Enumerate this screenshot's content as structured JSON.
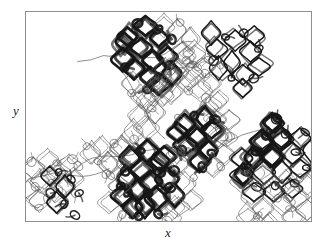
{
  "figure": {
    "type": "scatter",
    "background_color": "#ffffff",
    "frame": {
      "x": 25,
      "y": 11,
      "width": 287,
      "height": 211,
      "border_color": "#8e8e8e",
      "border_width": 1
    },
    "axes": {
      "x_label": "x",
      "y_label": "y",
      "x_tick_labels": [],
      "y_tick_labels": [],
      "grid": false
    }
  },
  "chart_data": {
    "type": "scatter",
    "title": "",
    "subtitle": "",
    "xlabel": "x",
    "ylabel": "y",
    "xlim": [
      0,
      287
    ],
    "ylim": [
      0,
      211
    ],
    "grid": false,
    "legend": null,
    "annotations": [],
    "styles": {
      "thick_stroke_color": "#171717",
      "thin_stroke_color": "#595959",
      "thick_stroke_width": 2.6,
      "medium_stroke_width": 1.5,
      "thin_stroke_width": 0.8,
      "cell_width": 20,
      "cell_height": 22,
      "loop_radius": 4.2
    },
    "clusters": [
      {
        "name": "top-left-dense",
        "origin": [
          95,
          10
        ],
        "weight": "thick",
        "cells": [
          [
            8,
            14
          ],
          [
            26,
            6
          ],
          [
            20,
            26
          ],
          [
            38,
            18
          ],
          [
            4,
            36
          ],
          [
            32,
            38
          ],
          [
            14,
            48
          ],
          [
            46,
            34
          ],
          [
            28,
            56
          ],
          [
            52,
            52
          ],
          [
            40,
            62
          ],
          [
            2,
            22
          ]
        ],
        "loops": [
          [
            18,
            2
          ],
          [
            6,
            46
          ],
          [
            40,
            8
          ],
          [
            50,
            44
          ],
          [
            26,
            68
          ],
          [
            52,
            18
          ]
        ]
      },
      {
        "name": "top-left-light",
        "origin": [
          95,
          10
        ],
        "weight": "thin",
        "cells": [
          [
            56,
            10
          ],
          [
            64,
            30
          ],
          [
            44,
            4
          ],
          [
            60,
            50
          ],
          [
            70,
            16
          ],
          [
            34,
            74
          ],
          [
            50,
            72
          ],
          [
            22,
            74
          ],
          [
            12,
            62
          ],
          [
            68,
            58
          ]
        ],
        "loops": [
          [
            60,
            2
          ],
          [
            72,
            42
          ],
          [
            36,
            62
          ],
          [
            10,
            72
          ],
          [
            68,
            70
          ]
        ]
      },
      {
        "name": "top-right",
        "origin": [
          186,
          20
        ],
        "weight": "medium",
        "cells": [
          [
            6,
            16
          ],
          [
            24,
            8
          ],
          [
            20,
            30
          ],
          [
            38,
            22
          ],
          [
            10,
            38
          ],
          [
            34,
            42
          ],
          [
            46,
            6
          ],
          [
            50,
            34
          ],
          [
            2,
            2
          ],
          [
            30,
            56
          ]
        ],
        "loops": [
          [
            16,
            4
          ],
          [
            34,
            2
          ],
          [
            4,
            28
          ],
          [
            44,
            48
          ],
          [
            22,
            46
          ],
          [
            50,
            18
          ]
        ]
      },
      {
        "name": "center-diagonal-strand",
        "origin": [
          98,
          56
        ],
        "weight": "thin",
        "cells": [
          [
            40,
            2
          ],
          [
            32,
            18
          ],
          [
            24,
            34
          ],
          [
            16,
            50
          ],
          [
            8,
            66
          ],
          [
            0,
            82
          ],
          [
            48,
            12
          ],
          [
            40,
            28
          ],
          [
            32,
            44
          ],
          [
            24,
            60
          ]
        ],
        "loops": [
          [
            44,
            10
          ],
          [
            28,
            42
          ],
          [
            12,
            74
          ]
        ]
      },
      {
        "name": "right-diagonal-strand",
        "origin": [
          160,
          40
        ],
        "weight": "thin",
        "cells": [
          [
            0,
            6
          ],
          [
            8,
            22
          ],
          [
            16,
            38
          ],
          [
            24,
            54
          ],
          [
            32,
            70
          ],
          [
            40,
            86
          ],
          [
            10,
            2
          ],
          [
            18,
            18
          ],
          [
            26,
            34
          ],
          [
            34,
            50
          ]
        ],
        "loops": [
          [
            4,
            14
          ],
          [
            20,
            46
          ],
          [
            36,
            78
          ]
        ]
      },
      {
        "name": "center-dark",
        "origin": [
          152,
          106
        ],
        "weight": "thick",
        "cells": [
          [
            8,
            6
          ],
          [
            26,
            0
          ],
          [
            18,
            20
          ],
          [
            36,
            14
          ],
          [
            10,
            30
          ],
          [
            30,
            34
          ],
          [
            22,
            44
          ],
          [
            2,
            16
          ]
        ],
        "loops": [
          [
            18,
            0
          ],
          [
            4,
            34
          ],
          [
            36,
            38
          ],
          [
            26,
            52
          ],
          [
            40,
            2
          ]
        ]
      },
      {
        "name": "center-dark-light-halo",
        "origin": [
          152,
          100
        ],
        "weight": "thin",
        "cells": [
          [
            42,
            24
          ],
          [
            0,
            44
          ],
          [
            46,
            44
          ],
          [
            36,
            56
          ],
          [
            52,
            8
          ]
        ],
        "loops": [
          [
            52,
            28
          ],
          [
            44,
            56
          ],
          [
            0,
            8
          ]
        ]
      },
      {
        "name": "bottom-center-dense",
        "origin": [
          96,
          138
        ],
        "weight": "thick",
        "cells": [
          [
            10,
            10
          ],
          [
            28,
            2
          ],
          [
            20,
            22
          ],
          [
            38,
            14
          ],
          [
            6,
            30
          ],
          [
            30,
            34
          ],
          [
            16,
            42
          ],
          [
            46,
            30
          ],
          [
            36,
            50
          ],
          [
            24,
            58
          ],
          [
            52,
            48
          ],
          [
            0,
            48
          ],
          [
            44,
            8
          ],
          [
            12,
            60
          ]
        ],
        "loops": [
          [
            20,
            2
          ],
          [
            4,
            22
          ],
          [
            40,
            24
          ],
          [
            8,
            44
          ],
          [
            28,
            46
          ],
          [
            48,
            40
          ],
          [
            18,
            68
          ],
          [
            38,
            66
          ],
          [
            54,
            24
          ],
          [
            0,
            36
          ]
        ]
      },
      {
        "name": "bottom-center-light",
        "origin": [
          96,
          134
        ],
        "weight": "thin",
        "cells": [
          [
            58,
            18
          ],
          [
            62,
            38
          ],
          [
            56,
            62
          ],
          [
            -8,
            18
          ],
          [
            -4,
            40
          ],
          [
            66,
            8
          ],
          [
            70,
            56
          ],
          [
            -12,
            58
          ],
          [
            50,
            72
          ],
          [
            8,
            76
          ]
        ],
        "loops": [
          [
            64,
            6
          ],
          [
            72,
            34
          ],
          [
            -10,
            32
          ],
          [
            46,
            76
          ],
          [
            0,
            70
          ]
        ]
      },
      {
        "name": "bottom-left",
        "origin": [
          2,
          146
        ],
        "weight": "thin",
        "cells": [
          [
            4,
            12
          ],
          [
            20,
            4
          ],
          [
            14,
            24
          ],
          [
            30,
            16
          ],
          [
            0,
            32
          ],
          [
            26,
            36
          ],
          [
            40,
            8
          ],
          [
            36,
            30
          ],
          [
            10,
            44
          ],
          [
            46,
            22
          ]
        ],
        "loops": [
          [
            2,
            4
          ],
          [
            16,
            16
          ],
          [
            30,
            6
          ],
          [
            8,
            30
          ],
          [
            24,
            28
          ],
          [
            40,
            22
          ],
          [
            12,
            50
          ],
          [
            34,
            48
          ],
          [
            48,
            38
          ],
          [
            52,
            10
          ],
          [
            20,
            42
          ],
          [
            46,
            4
          ]
        ]
      },
      {
        "name": "bottom-left-far",
        "origin": [
          26,
          160
        ],
        "weight": "medium",
        "cells": [
          [
            0,
            6
          ],
          [
            12,
            18
          ],
          [
            4,
            30
          ]
        ],
        "loops": [
          [
            6,
            2
          ],
          [
            18,
            10
          ],
          [
            0,
            22
          ],
          [
            14,
            34
          ],
          [
            26,
            24
          ],
          [
            22,
            44
          ]
        ]
      },
      {
        "name": "right-lattice",
        "origin": [
          216,
          108
        ],
        "weight": "medium",
        "cells": [
          [
            32,
            4
          ],
          [
            22,
            22
          ],
          [
            42,
            20
          ],
          [
            12,
            40
          ],
          [
            32,
            38
          ],
          [
            52,
            36
          ],
          [
            2,
            58
          ],
          [
            22,
            56
          ],
          [
            42,
            54
          ],
          [
            62,
            18
          ],
          [
            12,
            74
          ],
          [
            32,
            72
          ],
          [
            52,
            70
          ],
          [
            62,
            52
          ],
          [
            0,
            40
          ],
          [
            72,
            34
          ]
        ],
        "loops": [
          [
            36,
            0
          ],
          [
            26,
            16
          ],
          [
            16,
            34
          ],
          [
            6,
            52
          ],
          [
            46,
            16
          ],
          [
            56,
            32
          ],
          [
            36,
            66
          ],
          [
            16,
            68
          ],
          [
            66,
            14
          ],
          [
            56,
            66
          ],
          [
            66,
            48
          ]
        ]
      },
      {
        "name": "right-lattice-dark-edge",
        "origin": [
          216,
          108
        ],
        "weight": "thick",
        "cells": [
          [
            32,
            4
          ],
          [
            22,
            22
          ],
          [
            12,
            40
          ],
          [
            2,
            58
          ],
          [
            42,
            20
          ],
          [
            32,
            38
          ]
        ],
        "loops": [
          [
            36,
            0
          ],
          [
            26,
            16
          ],
          [
            16,
            34
          ],
          [
            6,
            52
          ]
        ]
      },
      {
        "name": "right-lower-light",
        "origin": [
          214,
          160
        ],
        "weight": "thin",
        "cells": [
          [
            2,
            10
          ],
          [
            20,
            2
          ],
          [
            12,
            26
          ],
          [
            34,
            18
          ],
          [
            26,
            38
          ],
          [
            48,
            10
          ],
          [
            44,
            34
          ],
          [
            58,
            26
          ],
          [
            8,
            46
          ],
          [
            30,
            54
          ],
          [
            56,
            48
          ],
          [
            70,
            14
          ],
          [
            68,
            40
          ],
          [
            20,
            58
          ]
        ],
        "loops": [
          [
            10,
            4
          ],
          [
            28,
            14
          ],
          [
            40,
            28
          ],
          [
            54,
            40
          ],
          [
            18,
            44
          ],
          [
            62,
            8
          ]
        ]
      },
      {
        "name": "mid-left-bridge",
        "origin": [
          60,
          128
        ],
        "weight": "thin",
        "cells": [
          [
            4,
            14
          ],
          [
            16,
            6
          ],
          [
            24,
            24
          ],
          [
            34,
            10
          ]
        ],
        "loops": [
          [
            0,
            6
          ],
          [
            12,
            22
          ],
          [
            28,
            4
          ],
          [
            38,
            26
          ],
          [
            20,
            36
          ]
        ]
      },
      {
        "name": "upper-bridge-loops",
        "origin": [
          146,
          46
        ],
        "weight": "thin",
        "cells": [],
        "loops": [
          [
            0,
            6
          ],
          [
            14,
            2
          ],
          [
            26,
            10
          ],
          [
            38,
            2
          ],
          [
            48,
            8
          ],
          [
            8,
            14
          ],
          [
            34,
            16
          ]
        ]
      }
    ],
    "connectors": [
      {
        "name": "top-bridge",
        "points": [
          [
            52,
            50
          ],
          [
            78,
            44
          ],
          [
            100,
            40
          ],
          [
            122,
            46
          ],
          [
            146,
            38
          ],
          [
            168,
            30
          ]
        ],
        "weight": "thin"
      },
      {
        "name": "center-bridge",
        "points": [
          [
            60,
            150
          ],
          [
            90,
            146
          ],
          [
            120,
            140
          ],
          [
            150,
            136
          ],
          [
            176,
            142
          ]
        ],
        "weight": "thin"
      },
      {
        "name": "left-bridge",
        "points": [
          [
            4,
            168
          ],
          [
            30,
            162
          ],
          [
            56,
            166
          ],
          [
            84,
            158
          ]
        ],
        "weight": "thin"
      },
      {
        "name": "right-bridge",
        "points": [
          [
            196,
            130
          ],
          [
            218,
            124
          ],
          [
            240,
            118
          ]
        ],
        "weight": "thin"
      },
      {
        "name": "diagonal-bridge",
        "points": [
          [
            96,
            60
          ],
          [
            110,
            84
          ],
          [
            124,
            108
          ],
          [
            140,
            128
          ]
        ],
        "weight": "thin"
      }
    ]
  }
}
